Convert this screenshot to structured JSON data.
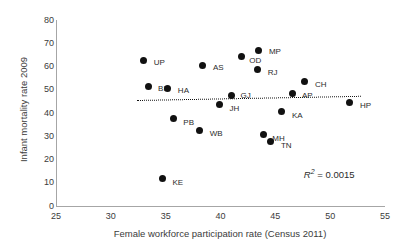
{
  "chart_data": {
    "type": "scatter",
    "title": "",
    "xlabel": "Female workforce participation rate (Census 2011)",
    "ylabel": "Infant mortality rate 2009",
    "xlim": [
      25,
      55
    ],
    "ylim": [
      0,
      80
    ],
    "xticks": [
      25,
      30,
      35,
      40,
      45,
      50,
      55
    ],
    "yticks": [
      0,
      10,
      20,
      30,
      40,
      50,
      60,
      70,
      80
    ],
    "grid": false,
    "legend": false,
    "annotations": [
      {
        "name": "r2",
        "symbol": "R",
        "superscript": "2",
        "equals": " = ",
        "value": "0.0015"
      }
    ],
    "trendline": {
      "style": "dotted",
      "color": "#111111",
      "x_start": 32.4,
      "y_start": 45.6,
      "x_end": 52.8,
      "y_end": 47.4
    },
    "points": [
      {
        "label": "UP",
        "x": 33.0,
        "y": 62.7,
        "label_dx": 10,
        "label_dy": 3
      },
      {
        "label": "BI",
        "x": 33.4,
        "y": 51.6,
        "label_dx": 10,
        "label_dy": 3
      },
      {
        "label": "HA",
        "x": 35.2,
        "y": 50.6,
        "label_dx": 10,
        "label_dy": 3
      },
      {
        "label": "AS",
        "x": 38.4,
        "y": 60.6,
        "label_dx": 10,
        "label_dy": 3
      },
      {
        "label": "OD",
        "x": 41.9,
        "y": 64.5,
        "label_dx": 8,
        "label_dy": 5
      },
      {
        "label": "MP",
        "x": 43.5,
        "y": 66.7,
        "label_dx": 10,
        "label_dy": 1
      },
      {
        "label": "RJ",
        "x": 43.4,
        "y": 58.5,
        "label_dx": 10,
        "label_dy": 3
      },
      {
        "label": "CH",
        "x": 47.7,
        "y": 53.4,
        "label_dx": 10,
        "label_dy": 3
      },
      {
        "label": "GJ",
        "x": 41.0,
        "y": 47.5,
        "label_dx": 9,
        "label_dy": 0
      },
      {
        "label": "AP",
        "x": 46.6,
        "y": 48.2,
        "label_dx": 9,
        "label_dy": 2
      },
      {
        "label": "HP",
        "x": 51.8,
        "y": 44.4,
        "label_dx": 10,
        "label_dy": 3
      },
      {
        "label": "JH",
        "x": 39.9,
        "y": 43.7,
        "label_dx": 10,
        "label_dy": 5
      },
      {
        "label": "KA",
        "x": 45.6,
        "y": 40.6,
        "label_dx": 10,
        "label_dy": 4
      },
      {
        "label": "PB",
        "x": 35.7,
        "y": 37.6,
        "label_dx": 10,
        "label_dy": 4
      },
      {
        "label": "WB",
        "x": 38.1,
        "y": 32.5,
        "label_dx": 10,
        "label_dy": 4
      },
      {
        "label": "MH",
        "x": 43.9,
        "y": 30.6,
        "label_dx": 9,
        "label_dy": 4
      },
      {
        "label": "TN",
        "x": 44.6,
        "y": 27.6,
        "label_dx": 10,
        "label_dy": 4
      },
      {
        "label": "KE",
        "x": 34.7,
        "y": 11.8,
        "label_dx": 10,
        "label_dy": 4
      }
    ]
  },
  "geometry": {
    "x_px_min": 56,
    "x_px_max": 385,
    "y_px_min": 206,
    "y_px_max": 20
  }
}
